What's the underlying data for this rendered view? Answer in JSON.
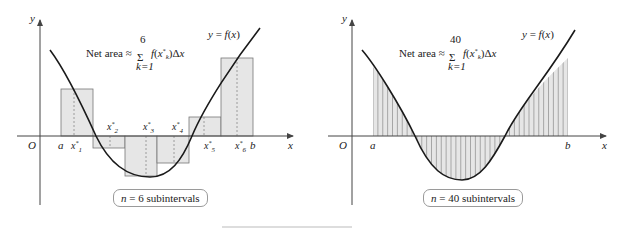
{
  "left_panel": {
    "axis_labels": {
      "y": "y",
      "x": "x",
      "origin": "O"
    },
    "interval_labels": {
      "a": "a",
      "b": "b"
    },
    "curve_label": "y = f(x)",
    "formula": {
      "prefix": "Net area ≈",
      "sum_upper": "6",
      "sum_lower": "k=1",
      "summand": "f(x*ₖ)Δx"
    },
    "sample_points": [
      "x*₁",
      "x*₂",
      "x*₃",
      "x*₄",
      "x*₅",
      "x*₆"
    ],
    "caption": {
      "var": "n",
      "text": " = 6 subintervals"
    }
  },
  "right_panel": {
    "axis_labels": {
      "y": "y",
      "x": "x",
      "origin": "O"
    },
    "interval_labels": {
      "a": "a",
      "b": "b"
    },
    "curve_label": "y = f(x)",
    "formula": {
      "prefix": "Net area ≈",
      "sum_upper": "40",
      "sum_lower": "k=1",
      "summand": "f(x*ₖ)Δx"
    },
    "caption": {
      "var": "n",
      "text": " = 40 subintervals"
    }
  },
  "colors": {
    "fill": "#e6e6e6",
    "stroke": "#555555",
    "curve": "#1a1a1a",
    "axis": "#444444"
  }
}
